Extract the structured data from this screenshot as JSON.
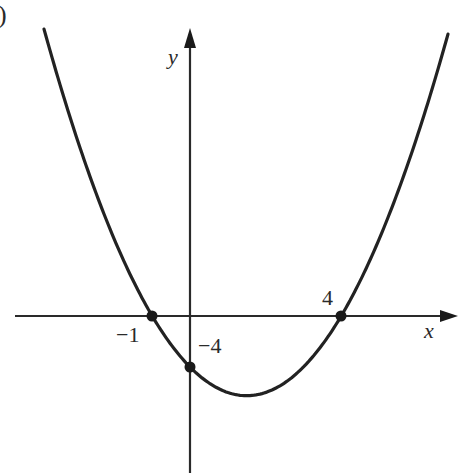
{
  "figure": {
    "corner_label": ")",
    "axes": {
      "x_label": "x",
      "y_label": "y",
      "origin_px": [
        190,
        316
      ],
      "x_scale_px_per_unit": 37.8,
      "y_scale_px_per_unit": 12.75
    },
    "curve": {
      "type": "parabola",
      "equation": "y = x^2 - 3x - 4",
      "opens": "up",
      "vertex": [
        1.5,
        -6.25
      ]
    },
    "points": [
      {
        "name": "x-intercept-left",
        "x": -1,
        "y": 0,
        "label": "−1"
      },
      {
        "name": "x-intercept-right",
        "x": 4,
        "y": 0,
        "label": "4"
      },
      {
        "name": "y-intercept",
        "x": 0,
        "y": -4,
        "label": "−4"
      }
    ],
    "colors": {
      "stroke": "#222222",
      "background": "#ffffff"
    }
  }
}
